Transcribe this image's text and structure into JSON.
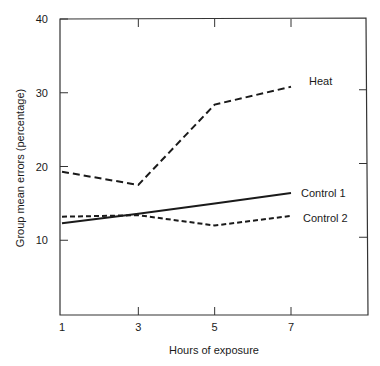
{
  "chart_data": {
    "type": "line",
    "title": "",
    "xlabel": "Hours of exposure",
    "ylabel": "Group mean errors (percentage)",
    "x": [
      1,
      3,
      5,
      7
    ],
    "x_ticks": [
      1,
      3,
      5,
      7
    ],
    "y_ticks": [
      10,
      20,
      30,
      40
    ],
    "xlim": [
      1,
      9
    ],
    "ylim": [
      0,
      40
    ],
    "grid": false,
    "legend_position": "inline labels at line ends",
    "series": [
      {
        "name": "Heat",
        "style": "dashed-long",
        "values": [
          19.3,
          17.5,
          28.4,
          30.8
        ]
      },
      {
        "name": "Control 1",
        "style": "solid",
        "values": [
          12.3,
          13.6,
          15.0,
          16.4
        ]
      },
      {
        "name": "Control 2",
        "style": "dashed-short",
        "values": [
          13.2,
          13.4,
          12.0,
          13.3
        ]
      }
    ]
  },
  "colors": {
    "line": "#1a1a1a",
    "background": "#ffffff"
  }
}
